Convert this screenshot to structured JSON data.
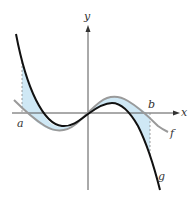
{
  "figure": {
    "labels": {
      "x_axis": "x",
      "y_axis": "y",
      "a": "a",
      "b": "b",
      "f": "f",
      "g": "g"
    },
    "colors": {
      "curve_g": "#111111",
      "curve_f": "#9a9a9a",
      "shading": "#cfe8f5",
      "axes": "#555555",
      "dashed": "#888888"
    }
  }
}
